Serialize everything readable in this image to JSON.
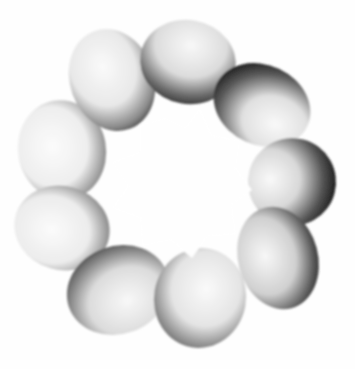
{
  "image": {
    "subject": "twisted torus surface with nine lobes",
    "style": "grayscale shaded 3D rendering",
    "background_color": "#fefefe",
    "highlight_color": "#f7f7f7",
    "shadow_color": "#2a2a2a"
  },
  "lobes": [
    {
      "id": "top-left",
      "cx": 112,
      "cy": 78,
      "rx": 42,
      "ry": 52,
      "rot": -20
    },
    {
      "id": "top",
      "cx": 188,
      "cy": 62,
      "rx": 48,
      "ry": 42,
      "rot": 10
    },
    {
      "id": "top-right",
      "cx": 262,
      "cy": 105,
      "rx": 50,
      "ry": 40,
      "rot": 25
    },
    {
      "id": "right",
      "cx": 292,
      "cy": 180,
      "rx": 44,
      "ry": 44,
      "rot": 60
    },
    {
      "id": "lower-right",
      "cx": 278,
      "cy": 258,
      "rx": 40,
      "ry": 52,
      "rot": -15
    },
    {
      "id": "bottom",
      "cx": 200,
      "cy": 298,
      "rx": 46,
      "ry": 50,
      "rot": 10
    },
    {
      "id": "bottom-left",
      "cx": 118,
      "cy": 290,
      "rx": 52,
      "ry": 44,
      "rot": -20
    },
    {
      "id": "left",
      "cx": 62,
      "cy": 228,
      "rx": 48,
      "ry": 42,
      "rot": 15
    },
    {
      "id": "upper-left",
      "cx": 62,
      "cy": 148,
      "rx": 44,
      "ry": 50,
      "rot": -10
    }
  ]
}
